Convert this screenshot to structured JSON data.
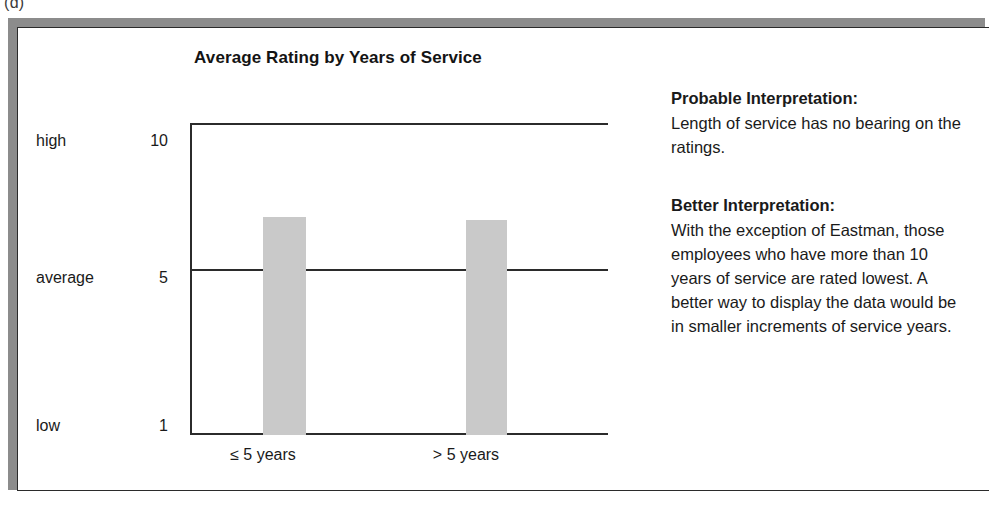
{
  "figure": {
    "label": "(d)"
  },
  "chart_data": {
    "type": "bar",
    "title": "Average Rating by Years of Service",
    "xlabel": "",
    "ylabel": "",
    "categories": [
      "≤ 5 years",
      "> 5 years"
    ],
    "values": [
      7.3,
      7.2
    ],
    "ylim": [
      1,
      10
    ],
    "yticks": [
      {
        "name": "high",
        "value": "10"
      },
      {
        "name": "average",
        "value": "5"
      },
      {
        "name": "low",
        "value": "1"
      }
    ],
    "gridlines": [
      "value 5 reference line"
    ],
    "grid": false,
    "legend": null,
    "bar_color": "#c9c9c9",
    "axis_color": "#2b2b2b"
  },
  "notes": [
    {
      "heading": "Probable Interpretation:",
      "body": "Length of service has no bearing on the ratings."
    },
    {
      "heading": "Better Interpretation:",
      "body": "With the exception of Eastman, those employees who have more than 10 years of service are rated lowest. A better way to display the data would be in smaller increments of service years."
    }
  ]
}
